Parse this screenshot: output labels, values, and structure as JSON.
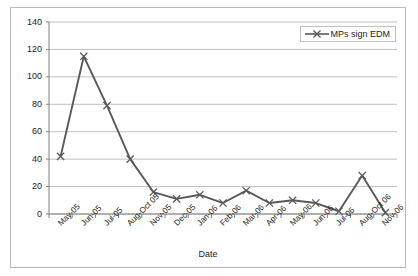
{
  "chart_data": {
    "type": "line",
    "title": "",
    "xlabel": "Date",
    "ylabel": "",
    "categories": [
      "May-05",
      "Jun-05",
      "Jul-05",
      "Aug-Oct 05",
      "Nov-05",
      "Dec-05",
      "Jan-06",
      "Feb-06",
      "Mar-06",
      "Apr-06",
      "May-06",
      "Jun-06",
      "Jul-06",
      "Aug-Oct 06",
      "Nov-06"
    ],
    "series": [
      {
        "name": "MPs sign EDM",
        "values": [
          42,
          115,
          79,
          40,
          16,
          11,
          14,
          8,
          17,
          8,
          10,
          8,
          2,
          28,
          1
        ],
        "color": "#595959",
        "marker": "x"
      }
    ],
    "ylim": [
      0,
      140
    ],
    "yticks": [
      0,
      20,
      40,
      60,
      80,
      100,
      120,
      140
    ],
    "ytick_labels": [
      "0",
      "20",
      "40",
      "60",
      "80",
      "100",
      "120",
      "140"
    ],
    "grid": "horizontal",
    "legend_position": "top-right",
    "legend_entries": [
      "MPs sign EDM"
    ]
  },
  "colors": {
    "series": "#595959",
    "gridline": "#bfbfbf",
    "axis": "#808080",
    "frame": "#b9b9b9",
    "text": "#1d1d1d",
    "background": "#ffffff"
  }
}
